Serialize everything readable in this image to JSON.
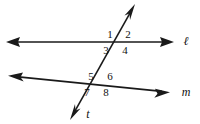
{
  "figure": {
    "background_color": "#ffffff",
    "stroke_color": "#1a1a1a",
    "text_color": "#101010"
  },
  "lines": {
    "line_l": {
      "label": "ℓ",
      "name": "horizontal-line-l",
      "label_x": 186,
      "label_y": 42,
      "x1": 8,
      "y1": 42,
      "x2": 172,
      "y2": 42,
      "arrow_left": true,
      "arrow_right": true
    },
    "line_m": {
      "label": "m",
      "name": "horizontal-line-m",
      "label_x": 186,
      "label_y": 93,
      "x1": 10,
      "y1": 76,
      "x2": 168,
      "y2": 92,
      "arrow_left": true,
      "arrow_right": true
    },
    "line_t": {
      "label": "t",
      "name": "transversal-line-t",
      "label_x": 88,
      "label_y": 115,
      "x1": 134,
      "y1": 6,
      "x2": 71,
      "y2": 118,
      "arrow_top": true,
      "arrow_bottom": true
    }
  },
  "intersections": {
    "upper": {
      "name": "intersection-l-t",
      "x": 118,
      "y": 42
    },
    "lower": {
      "name": "intersection-m-t",
      "x": 100,
      "y": 84
    }
  },
  "angles": [
    {
      "id": "angle-1",
      "label": "1",
      "x": 110,
      "y": 35,
      "position": "upper-left"
    },
    {
      "id": "angle-2",
      "label": "2",
      "x": 128,
      "y": 35,
      "position": "upper-right"
    },
    {
      "id": "angle-3",
      "label": "3",
      "x": 106,
      "y": 51,
      "position": "lower-left"
    },
    {
      "id": "angle-4",
      "label": "4",
      "x": 125,
      "y": 51,
      "position": "lower-right"
    },
    {
      "id": "angle-5",
      "label": "5",
      "x": 91,
      "y": 77,
      "position": "upper-left"
    },
    {
      "id": "angle-6",
      "label": "6",
      "x": 110,
      "y": 77,
      "position": "upper-right"
    },
    {
      "id": "angle-7",
      "label": "7",
      "x": 87,
      "y": 93,
      "position": "lower-left"
    },
    {
      "id": "angle-8",
      "label": "8",
      "x": 106,
      "y": 93,
      "position": "lower-right"
    }
  ]
}
